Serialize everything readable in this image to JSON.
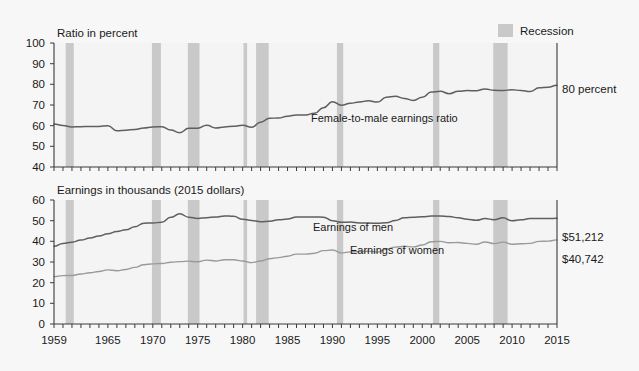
{
  "figure": {
    "background_color": "#f7f7f7",
    "legend": {
      "swatch_color": "#c9c9c9",
      "label": "Recession"
    }
  },
  "chart_data": [
    {
      "type": "line",
      "id": "ratio-panel",
      "title": "",
      "ylabel": "Ratio in percent",
      "xlabel": "",
      "ylim": [
        40,
        100
      ],
      "xlim": [
        1959,
        2015
      ],
      "yticks": [
        40,
        50,
        60,
        70,
        80,
        90,
        100
      ],
      "xticks": [
        1959,
        1965,
        1970,
        1975,
        1980,
        1985,
        1990,
        1995,
        2000,
        2005,
        2010,
        2015
      ],
      "grid": false,
      "legend_position": "inline-annotation",
      "annotations": [
        {
          "text": "Female-to-male earnings ratio",
          "x": 1988,
          "y": 66
        },
        {
          "text": "80 percent",
          "x": 2015,
          "y": 80
        }
      ],
      "series": [
        {
          "name": "Female-to-male earnings ratio",
          "color": "#5f5f5f",
          "x": [
            1959,
            1960,
            1961,
            1962,
            1963,
            1964,
            1965,
            1966,
            1967,
            1968,
            1969,
            1970,
            1971,
            1972,
            1973,
            1974,
            1975,
            1976,
            1977,
            1978,
            1979,
            1980,
            1981,
            1982,
            1983,
            1984,
            1985,
            1986,
            1987,
            1988,
            1989,
            1990,
            1991,
            1992,
            1993,
            1994,
            1995,
            1996,
            1997,
            1998,
            1999,
            2000,
            2001,
            2002,
            2003,
            2004,
            2005,
            2006,
            2007,
            2008,
            2009,
            2010,
            2011,
            2012,
            2013,
            2014,
            2015
          ],
          "values": [
            60.8,
            60.1,
            59.4,
            59.5,
            59.6,
            59.6,
            60.0,
            57.6,
            57.8,
            58.2,
            58.9,
            59.4,
            59.5,
            57.9,
            56.6,
            58.8,
            58.8,
            60.2,
            58.9,
            59.4,
            59.7,
            60.2,
            59.2,
            61.7,
            63.6,
            63.7,
            64.6,
            65.2,
            65.2,
            66.0,
            68.7,
            71.6,
            69.9,
            70.8,
            71.5,
            72.0,
            71.4,
            73.8,
            74.2,
            73.2,
            72.2,
            73.7,
            76.3,
            76.6,
            75.5,
            76.6,
            77.0,
            76.9,
            77.8,
            77.1,
            77.0,
            77.4,
            77.0,
            76.5,
            78.3,
            78.6,
            79.6
          ]
        }
      ],
      "recession_bands": [
        {
          "start": 1960.3,
          "end": 1961.2
        },
        {
          "start": 1969.9,
          "end": 1970.9
        },
        {
          "start": 1973.9,
          "end": 1975.2
        },
        {
          "start": 1980.1,
          "end": 1980.5
        },
        {
          "start": 1981.5,
          "end": 1982.9
        },
        {
          "start": 1990.5,
          "end": 1991.2
        },
        {
          "start": 2001.2,
          "end": 2001.9
        },
        {
          "start": 2007.9,
          "end": 2009.5
        }
      ]
    },
    {
      "type": "line",
      "id": "earnings-panel",
      "title": "",
      "ylabel": "Earnings in thousands (2015 dollars)",
      "xlabel": "",
      "ylim": [
        0,
        60
      ],
      "xlim": [
        1959,
        2015
      ],
      "yticks": [
        0,
        10,
        20,
        30,
        40,
        50,
        60
      ],
      "xticks": [
        1959,
        1965,
        1970,
        1975,
        1980,
        1985,
        1990,
        1995,
        2000,
        2005,
        2010,
        2015
      ],
      "grid": false,
      "legend_position": "inline-annotation",
      "annotations": [
        {
          "text": "Earnings of men",
          "x": 1993,
          "y": 43
        },
        {
          "text": "Earnings of women",
          "x": 1997,
          "y": 34
        },
        {
          "text": "$51,212",
          "x": 2015,
          "y": 51.2
        },
        {
          "text": "$40,742",
          "x": 2015,
          "y": 40.7
        }
      ],
      "series": [
        {
          "name": "Earnings of men",
          "color": "#5f5f5f",
          "x": [
            1959,
            1960,
            1961,
            1962,
            1963,
            1964,
            1965,
            1966,
            1967,
            1968,
            1969,
            1970,
            1971,
            1972,
            1973,
            1974,
            1975,
            1976,
            1977,
            1978,
            1979,
            1980,
            1981,
            1982,
            1983,
            1984,
            1985,
            1986,
            1987,
            1988,
            1989,
            1990,
            1991,
            1992,
            1993,
            1994,
            1995,
            1996,
            1997,
            1998,
            1999,
            2000,
            2001,
            2002,
            2003,
            2004,
            2005,
            2006,
            2007,
            2008,
            2009,
            2010,
            2011,
            2012,
            2013,
            2014,
            2015
          ],
          "values": [
            37.6,
            39.0,
            39.6,
            40.6,
            41.6,
            42.6,
            43.7,
            44.8,
            45.6,
            47.0,
            48.8,
            48.9,
            49.2,
            51.6,
            53.3,
            51.7,
            51.1,
            51.4,
            51.8,
            52.3,
            52.1,
            50.7,
            50.1,
            49.5,
            49.7,
            50.4,
            50.8,
            51.8,
            51.8,
            51.8,
            51.7,
            50.0,
            49.2,
            49.3,
            48.9,
            48.9,
            48.7,
            49.0,
            50.1,
            51.4,
            51.6,
            51.9,
            52.2,
            52.2,
            52.0,
            51.4,
            50.7,
            50.2,
            51.0,
            50.5,
            51.4,
            49.9,
            50.4,
            51.0,
            51.1,
            51.0,
            51.2
          ]
        },
        {
          "name": "Earnings of women",
          "color": "#9a9a9a",
          "x": [
            1959,
            1960,
            1961,
            1962,
            1963,
            1964,
            1965,
            1966,
            1967,
            1968,
            1969,
            1970,
            1971,
            1972,
            1973,
            1974,
            1975,
            1976,
            1977,
            1978,
            1979,
            1980,
            1981,
            1982,
            1983,
            1984,
            1985,
            1986,
            1987,
            1988,
            1989,
            1990,
            1991,
            1992,
            1993,
            1994,
            1995,
            1996,
            1997,
            1998,
            1999,
            2000,
            2001,
            2002,
            2003,
            2004,
            2005,
            2006,
            2007,
            2008,
            2009,
            2010,
            2011,
            2012,
            2013,
            2014,
            2015
          ],
          "values": [
            22.9,
            23.4,
            23.5,
            24.2,
            24.8,
            25.4,
            26.2,
            25.8,
            26.4,
            27.4,
            28.7,
            29.1,
            29.3,
            29.9,
            30.2,
            30.4,
            30.1,
            30.9,
            30.5,
            31.1,
            31.1,
            30.5,
            29.7,
            30.5,
            31.6,
            32.1,
            32.8,
            33.8,
            33.8,
            34.2,
            35.5,
            35.8,
            34.4,
            34.9,
            35.0,
            35.2,
            34.8,
            36.2,
            37.2,
            37.6,
            37.3,
            38.2,
            39.8,
            40.0,
            39.3,
            39.4,
            39.0,
            38.6,
            39.7,
            38.9,
            39.6,
            38.6,
            38.8,
            39.0,
            40.0,
            40.1,
            40.7
          ]
        }
      ],
      "recession_bands": [
        {
          "start": 1960.3,
          "end": 1961.2
        },
        {
          "start": 1969.9,
          "end": 1970.9
        },
        {
          "start": 1973.9,
          "end": 1975.2
        },
        {
          "start": 1980.1,
          "end": 1980.5
        },
        {
          "start": 1981.5,
          "end": 1982.9
        },
        {
          "start": 1990.5,
          "end": 1991.2
        },
        {
          "start": 2001.2,
          "end": 2001.9
        },
        {
          "start": 2007.9,
          "end": 2009.5
        }
      ]
    }
  ]
}
